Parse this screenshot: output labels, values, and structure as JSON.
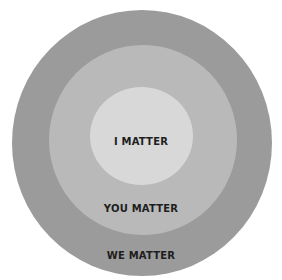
{
  "diagram": {
    "type": "concentric-circles",
    "rings": [
      {
        "label": "WE MATTER",
        "color": "#9b9b9b"
      },
      {
        "label": "YOU MATTER",
        "color": "#b9b9b9"
      },
      {
        "label": "I MATTER",
        "color": "#d8d8d8"
      }
    ]
  }
}
